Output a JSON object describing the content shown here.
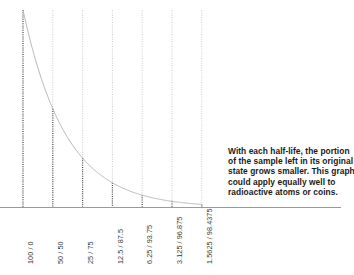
{
  "figure": {
    "background_color": "#ffffff"
  },
  "annotation": {
    "name": "half-life-explanation",
    "lines": [
      "With each half-life, the portion",
      "of the sample left in its original",
      "state grows smaller. This graph",
      "could apply equally well to",
      "radioactive atoms or coins."
    ],
    "text_color": "#1a1a1a"
  },
  "axis": {
    "baseline_color": "#9a9a9a",
    "grid_light_color": "#c9c9c9",
    "grid_dark_color": "#4a4a4a",
    "curve_color": "#b0b0b0"
  },
  "chart_data": {
    "type": "line",
    "xlabel": "",
    "ylabel": "",
    "grid": true,
    "legend": "none",
    "annotation": "With each half-life, the portion of the sample left in its original state grows smaller. This graph could apply equally well to radioactive atoms or coins.",
    "categories": [
      "100 / 0",
      "50 / 50",
      "25 / 75",
      "12.5 / 87.5",
      "6.25 / 93.75",
      "3.125 / 96.875",
      "1.5625 / 98.4375"
    ],
    "x": [
      0,
      1,
      2,
      3,
      4,
      5,
      6
    ],
    "series": [
      {
        "name": "remaining in original state (%)",
        "values": [
          100,
          50,
          25,
          12.5,
          6.25,
          3.125,
          1.5625
        ]
      },
      {
        "name": "decayed (%)",
        "values": [
          0,
          50,
          75,
          87.5,
          93.75,
          96.875,
          98.4375
        ]
      }
    ],
    "ylim": [
      0,
      100
    ],
    "xlim": [
      0,
      6
    ],
    "tick_labels": [
      "100 / 0",
      "50 / 50",
      "25 / 75",
      "12.5 / 87.5",
      "6.25 / 93.75",
      "3.125 / 96.875",
      "1.5625 / 98.4375"
    ]
  }
}
